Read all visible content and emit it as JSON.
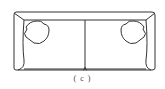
{
  "figure": {
    "caption": "( c )",
    "line_color": "#333333",
    "background": "#ffffff"
  }
}
